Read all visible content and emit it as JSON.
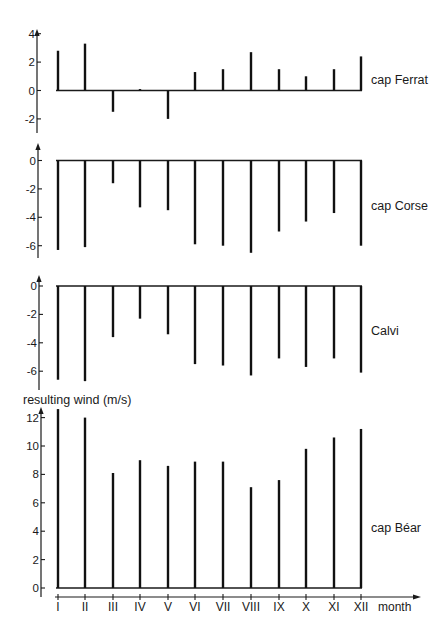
{
  "figure": {
    "x_axis_label": "month",
    "y_axis_label": "resulting wind (m/s)",
    "months": [
      "I",
      "II",
      "III",
      "IV",
      "V",
      "VI",
      "VII",
      "VIII",
      "IX",
      "X",
      "XI",
      "XII"
    ]
  },
  "chart_data": [
    {
      "type": "bar",
      "title": "cap Ferrat",
      "xlabel": "month",
      "ylabel": "resulting wind (m/s)",
      "categories": [
        "I",
        "II",
        "III",
        "IV",
        "V",
        "VI",
        "VII",
        "VIII",
        "IX",
        "X",
        "XI",
        "XII"
      ],
      "values": [
        2.8,
        3.3,
        -1.5,
        0.1,
        -2.0,
        1.3,
        1.5,
        2.7,
        1.5,
        1.0,
        1.5,
        2.4
      ],
      "yticks": [
        4,
        2,
        0,
        -2
      ],
      "ylim": [
        -3,
        4.3
      ],
      "grid": false
    },
    {
      "type": "bar",
      "title": "cap Corse",
      "xlabel": "month",
      "ylabel": "resulting wind (m/s)",
      "categories": [
        "I",
        "II",
        "III",
        "IV",
        "V",
        "VI",
        "VII",
        "VIII",
        "IX",
        "X",
        "XI",
        "XII"
      ],
      "values": [
        -6.3,
        -6.1,
        -1.6,
        -3.3,
        -3.5,
        -5.9,
        -6.0,
        -6.5,
        -5.0,
        -4.3,
        -3.7,
        -6.0
      ],
      "yticks": [
        0,
        -2,
        -4,
        -6
      ],
      "ylim": [
        -7,
        1.2
      ],
      "grid": false
    },
    {
      "type": "bar",
      "title": "Calvi",
      "xlabel": "month",
      "ylabel": "resulting wind (m/s)",
      "categories": [
        "I",
        "II",
        "III",
        "IV",
        "V",
        "VI",
        "VII",
        "VIII",
        "IX",
        "X",
        "XI",
        "XII"
      ],
      "values": [
        -6.6,
        -6.7,
        -3.6,
        -2.3,
        -3.4,
        -5.5,
        -5.6,
        -6.3,
        -5.1,
        -5.7,
        -5.1,
        -6.1
      ],
      "yticks": [
        0,
        -2,
        -4,
        -6
      ],
      "ylim": [
        -7.2,
        0.8
      ],
      "grid": false
    },
    {
      "type": "bar",
      "title": "cap Béar",
      "xlabel": "month",
      "ylabel": "resulting wind (m/s)",
      "categories": [
        "I",
        "II",
        "III",
        "IV",
        "V",
        "VI",
        "VII",
        "VIII",
        "IX",
        "X",
        "XI",
        "XII"
      ],
      "values": [
        12.6,
        12.0,
        8.1,
        9.0,
        8.6,
        8.9,
        8.9,
        7.1,
        7.6,
        9.8,
        10.6,
        11.2
      ],
      "yticks": [
        0,
        2,
        4,
        6,
        8,
        10,
        12
      ],
      "ylim": [
        0,
        12.8
      ],
      "grid": false
    }
  ],
  "layout": {
    "month_x": [
      58,
      85,
      113,
      140,
      168,
      195,
      223,
      251,
      279,
      306,
      334,
      361
    ],
    "baseline_x": [
      56,
      362
    ],
    "px_per_unit": 14.2,
    "panels": [
      {
        "zero_y": 90.5,
        "axis_x": 37,
        "axis_top": 29,
        "axis_bottom": 133,
        "label_y": 84
      },
      {
        "zero_y": 160.5,
        "axis_x": 38,
        "axis_top": 143,
        "axis_bottom": 258,
        "label_y": 210
      },
      {
        "zero_y": 286,
        "axis_x": 39,
        "axis_top": 275,
        "axis_bottom": 390,
        "label_y": 335
      },
      {
        "zero_y": 588,
        "axis_x": 41,
        "axis_top": 407,
        "axis_bottom": 597,
        "label_y": 532
      }
    ],
    "x_axis": {
      "y": 597,
      "x_start": 55,
      "x_end": 421,
      "label_y": 611
    }
  }
}
